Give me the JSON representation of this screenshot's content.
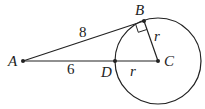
{
  "diagram": {
    "points": {
      "A": {
        "label": "A",
        "x": 23,
        "y": 61
      },
      "B": {
        "label": "B",
        "x": 144,
        "y": 21
      },
      "C": {
        "label": "C",
        "x": 158,
        "y": 61
      },
      "D": {
        "label": "D",
        "x": 115,
        "y": 61
      }
    },
    "circle": {
      "center": "C",
      "radius_px": 43
    },
    "segment_labels": {
      "AB": "8",
      "AD": "6",
      "BC": "r",
      "DC": "r"
    },
    "annotations": [
      "right-angle at B"
    ],
    "colors": {
      "stroke": "#222222",
      "background": "#ffffff"
    }
  }
}
